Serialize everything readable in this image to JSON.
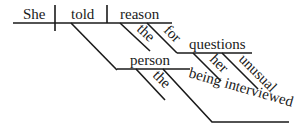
{
  "diagram": {
    "type": "sentence-diagram",
    "subject": "She",
    "verb": "told",
    "direct_object": "reason",
    "direct_object_modifiers": [
      "the"
    ],
    "prepositional_phrase": {
      "preposition": "for",
      "object": "questions",
      "modifiers": [
        "her",
        "unusual"
      ]
    },
    "indirect_object": "person",
    "indirect_object_modifiers": [
      "the"
    ],
    "participial_phrase": "being interviewed",
    "line_color": "#1a1a1a",
    "background": "#ffffff"
  }
}
